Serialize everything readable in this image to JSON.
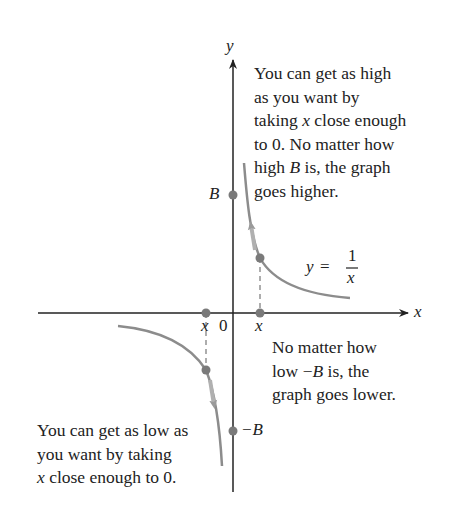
{
  "figure": {
    "function_label": {
      "lhs": "y",
      "eq": "=",
      "num": "1",
      "den": "x"
    },
    "axes": {
      "x_label": "x",
      "y_label": "y",
      "origin_label": "0"
    },
    "point_labels": {
      "B": "B",
      "neg_B": "−B",
      "x_pos": "x",
      "x_neg": "x"
    },
    "annotations": {
      "top": [
        "You can get as high",
        "as you want by",
        "taking {x} close enough",
        "to 0.  No  matter how",
        "high {B} is, the graph",
        "goes higher."
      ],
      "top_lines": {
        "l1": "You can get as high",
        "l2": "as you want by",
        "l3a": "taking ",
        "l3x": "x",
        "l3b": " close enough",
        "l4": "to 0.  No  matter how",
        "l5a": "high ",
        "l5B": "B",
        "l5b": " is, the graph",
        "l6": "goes higher."
      },
      "middle_lines": {
        "l1": "No matter how",
        "l2a": "low −",
        "l2B": "B",
        "l2b": " is,  the",
        "l3": "graph goes lower."
      },
      "bottom_lines": {
        "l1": "You can get as low as",
        "l2": "you want by taking",
        "l3x": "x",
        "l3b": " close enough to 0."
      }
    },
    "colors": {
      "axis": "#222222",
      "curve": "#8a8a8a",
      "point": "#7a7a7a",
      "text": "#222222"
    }
  }
}
